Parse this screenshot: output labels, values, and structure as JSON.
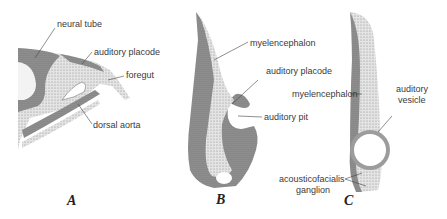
{
  "figure": {
    "panels": [
      {
        "letter": "A",
        "labels": {
          "neural_tube": "neural tube",
          "auditory_placode": "auditory placode",
          "foregut": "foregut",
          "dorsal_aorta": "dorsal aorta"
        }
      },
      {
        "letter": "B",
        "labels": {
          "myelencephalon": "myelencephalon",
          "auditory_placode": "auditory placode",
          "auditory_pit": "auditory pit"
        }
      },
      {
        "letter": "C",
        "labels": {
          "myelencephalon": "myelencephalon",
          "auditory_vesicle_line1": "auditory",
          "auditory_vesicle_line2": "vesicle",
          "ganglion_line1": "acousticofacialis",
          "ganglion_line2": "ganglion"
        }
      }
    ],
    "colors": {
      "dark_tissue": "#8a8a8a",
      "light_tissue": "#d4d4d4",
      "line": "#444444",
      "background": "#ffffff"
    }
  }
}
